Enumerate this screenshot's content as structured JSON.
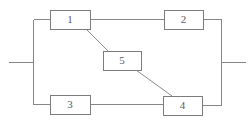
{
  "diagram": {
    "type": "reliability-block-diagram",
    "name": "bridge-network",
    "canvas": {
      "width": 250,
      "height": 122,
      "background": "#ffffff"
    },
    "style": {
      "wire_color": "#868686",
      "diagonal_color": "#8d8d8d",
      "block_border_color": "#7c7c7c",
      "block_fill_color": "#ffffff",
      "label_color": "#5a5a5a",
      "stroke_width": 1
    },
    "blocks": [
      {
        "id": "block-1",
        "label": "1",
        "x": 50,
        "y": 10,
        "width": 40,
        "height": 19
      },
      {
        "id": "block-2",
        "label": "2",
        "x": 164,
        "y": 10,
        "width": 39,
        "height": 19
      },
      {
        "id": "block-5",
        "label": "5",
        "x": 103,
        "y": 51,
        "width": 38,
        "height": 19
      },
      {
        "id": "block-3",
        "label": "3",
        "x": 50,
        "y": 95,
        "width": 40,
        "height": 19
      },
      {
        "id": "block-4",
        "label": "4",
        "x": 163,
        "y": 96,
        "width": 39,
        "height": 19
      }
    ],
    "wires": [
      {
        "id": "input-lead",
        "points": "8,62 33,62"
      },
      {
        "id": "left-bus",
        "points": "33,19 33,104"
      },
      {
        "id": "left-bus-to-1",
        "points": "33,19 50,19"
      },
      {
        "id": "left-bus-to-3",
        "points": "33,104 50,104"
      },
      {
        "id": "block1-to-block2",
        "points": "90,19 164,19"
      },
      {
        "id": "block3-to-block4",
        "points": "90,104 163,104"
      },
      {
        "id": "block2-to-right",
        "points": "203,19 221,19"
      },
      {
        "id": "block4-to-right",
        "points": "202,105 221,105"
      },
      {
        "id": "right-bus",
        "points": "221,19 221,105"
      },
      {
        "id": "output-lead",
        "points": "221,62 245,62"
      }
    ],
    "diagonals": [
      {
        "id": "block1-to-block5",
        "from": "block-1",
        "to": "block-5",
        "points": "86,29 108,51"
      },
      {
        "id": "block5-to-block4",
        "from": "block-5",
        "to": "block-4",
        "points": "136,70 172,96"
      }
    ],
    "terminals": [
      {
        "id": "input-terminal",
        "label": "",
        "x": 8,
        "y": 62
      },
      {
        "id": "output-terminal",
        "label": "",
        "x": 245,
        "y": 62
      }
    ]
  }
}
